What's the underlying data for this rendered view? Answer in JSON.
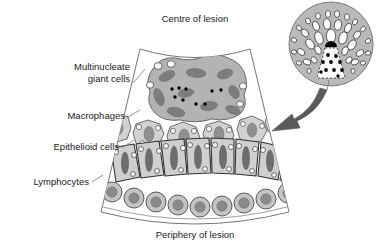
{
  "figure": {
    "title_top": "Centre of lesion",
    "title_bottom": "Periphery of lesion",
    "labels": {
      "giant_cells_line1": "Multinucleate",
      "giant_cells_line2": "giant cells",
      "macrophages": "Macrophages",
      "epithelioid": "Epithelioid cells",
      "lymphocytes": "Lymphocytes"
    },
    "colors": {
      "background": "#ffffff",
      "outline": "#555555",
      "giant_cell_body": "#b3b3b3",
      "giant_cell_nucleus": "#7d7d7d",
      "macrophage_body": "#d2d2d2",
      "macrophage_nucleus": "#8f8f8f",
      "epithelioid_body": "#cfcfcf",
      "epithelioid_nucleus": "#6e6e6e",
      "lymphocyte_body": "#c4c4c4",
      "lymphocyte_nucleus": "#8a8a8a",
      "inset_disc": "#b9b9b9",
      "arrow": "#5a5a5a",
      "dot": "#000000",
      "vacuole": "#ffffff"
    },
    "inset": {
      "name": "granuloma-cross-section",
      "wedge_dot_count": 10,
      "ring_cell_counts": [
        7,
        12,
        16,
        14
      ]
    },
    "counts": {
      "giant_cell_nuclei": 9,
      "giant_cell_dots": 9,
      "macrophages": 7,
      "epithelioid_cells": 8,
      "lymphocytes": 11
    }
  }
}
